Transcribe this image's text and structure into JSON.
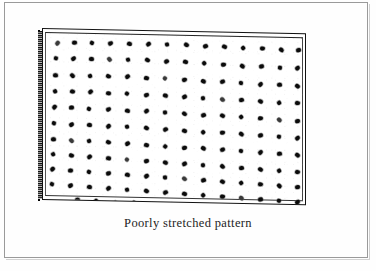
{
  "figure": {
    "caption": "Poorly stretched pattern",
    "kind": "scanned-book-figure",
    "description_label": "dot-pattern-slab",
    "colors": {
      "page_background": "#fefefe",
      "frame_rule": "#9a9a9a",
      "slab_outline": "#111111",
      "slab_face": "#ffffff",
      "dot_ink": "#0b0b0b",
      "caption_text": "#1d1d1d"
    },
    "slab": {
      "label": "stretched-fabric-slab",
      "edge_label": "slab-thickness-edge",
      "face_label": "slab-face"
    }
  },
  "page_frame": {
    "label": "page-border"
  },
  "chart_data": {
    "type": "scatter",
    "title": "Poorly stretched pattern",
    "xlabel": "",
    "ylabel": "",
    "grid": false,
    "legend": null,
    "xlim": [
      0,
      264
    ],
    "ylim": [
      0,
      172
    ],
    "rows": 12,
    "nominal_cols": 16,
    "points": [
      [
        10,
        10
      ],
      [
        27,
        9
      ],
      [
        45,
        9
      ],
      [
        63,
        9
      ],
      [
        82,
        9
      ],
      [
        101,
        9
      ],
      [
        120,
        9
      ],
      [
        139,
        9
      ],
      [
        158,
        10
      ],
      [
        177,
        10
      ],
      [
        196,
        11
      ],
      [
        215,
        11
      ],
      [
        234,
        12
      ],
      [
        251,
        12
      ],
      [
        9,
        25
      ],
      [
        26,
        25
      ],
      [
        44,
        25
      ],
      [
        62,
        25
      ],
      [
        81,
        25
      ],
      [
        100,
        25
      ],
      [
        119,
        26
      ],
      [
        138,
        26
      ],
      [
        157,
        27
      ],
      [
        176,
        28
      ],
      [
        195,
        29
      ],
      [
        214,
        29
      ],
      [
        233,
        30
      ],
      [
        250,
        30
      ],
      [
        8,
        42
      ],
      [
        25,
        42
      ],
      [
        43,
        42
      ],
      [
        61,
        42
      ],
      [
        80,
        42
      ],
      [
        99,
        43
      ],
      [
        118,
        43
      ],
      [
        137,
        44
      ],
      [
        156,
        45
      ],
      [
        175,
        45
      ],
      [
        194,
        46
      ],
      [
        213,
        47
      ],
      [
        232,
        47
      ],
      [
        250,
        48
      ],
      [
        8,
        58
      ],
      [
        25,
        58
      ],
      [
        43,
        58
      ],
      [
        61,
        59
      ],
      [
        80,
        59
      ],
      [
        99,
        60
      ],
      [
        118,
        60
      ],
      [
        137,
        61
      ],
      [
        156,
        62
      ],
      [
        175,
        63
      ],
      [
        194,
        63
      ],
      [
        213,
        64
      ],
      [
        232,
        65
      ],
      [
        250,
        65
      ],
      [
        7,
        74
      ],
      [
        24,
        74
      ],
      [
        42,
        75
      ],
      [
        61,
        75
      ],
      [
        80,
        76
      ],
      [
        99,
        76
      ],
      [
        118,
        77
      ],
      [
        137,
        78
      ],
      [
        156,
        79
      ],
      [
        175,
        79
      ],
      [
        194,
        80
      ],
      [
        213,
        81
      ],
      [
        232,
        82
      ],
      [
        250,
        83
      ],
      [
        7,
        90
      ],
      [
        24,
        91
      ],
      [
        42,
        91
      ],
      [
        61,
        92
      ],
      [
        80,
        92
      ],
      [
        99,
        93
      ],
      [
        118,
        94
      ],
      [
        137,
        95
      ],
      [
        156,
        96
      ],
      [
        175,
        96
      ],
      [
        194,
        97
      ],
      [
        213,
        98
      ],
      [
        232,
        99
      ],
      [
        250,
        100
      ],
      [
        6,
        106
      ],
      [
        24,
        107
      ],
      [
        42,
        107
      ],
      [
        61,
        108
      ],
      [
        80,
        109
      ],
      [
        99,
        110
      ],
      [
        118,
        111
      ],
      [
        137,
        112
      ],
      [
        156,
        112
      ],
      [
        175,
        113
      ],
      [
        194,
        114
      ],
      [
        213,
        115
      ],
      [
        232,
        116
      ],
      [
        250,
        117
      ],
      [
        6,
        121
      ],
      [
        24,
        122
      ],
      [
        42,
        123
      ],
      [
        61,
        124
      ],
      [
        80,
        125
      ],
      [
        99,
        126
      ],
      [
        118,
        127
      ],
      [
        137,
        128
      ],
      [
        156,
        129
      ],
      [
        175,
        130
      ],
      [
        194,
        131
      ],
      [
        213,
        132
      ],
      [
        232,
        133
      ],
      [
        250,
        134
      ],
      [
        5,
        136
      ],
      [
        23,
        137
      ],
      [
        42,
        138
      ],
      [
        61,
        139
      ],
      [
        80,
        140
      ],
      [
        99,
        141
      ],
      [
        118,
        142
      ],
      [
        137,
        143
      ],
      [
        156,
        144
      ],
      [
        175,
        145
      ],
      [
        194,
        146
      ],
      [
        213,
        147
      ],
      [
        232,
        148
      ],
      [
        250,
        149
      ],
      [
        5,
        151
      ],
      [
        23,
        152
      ],
      [
        42,
        153
      ],
      [
        61,
        154
      ],
      [
        80,
        155
      ],
      [
        99,
        156
      ],
      [
        118,
        157
      ],
      [
        137,
        158
      ],
      [
        156,
        159
      ],
      [
        175,
        160
      ],
      [
        194,
        161
      ],
      [
        213,
        162
      ],
      [
        232,
        163
      ],
      [
        250,
        164
      ],
      [
        30,
        166
      ],
      [
        49,
        167
      ],
      [
        68,
        168
      ],
      [
        87,
        168
      ],
      [
        106,
        169
      ],
      [
        125,
        169
      ],
      [
        144,
        170
      ],
      [
        163,
        170
      ],
      [
        182,
        170
      ],
      [
        201,
        170
      ],
      [
        220,
        170
      ],
      [
        239,
        170
      ]
    ]
  }
}
